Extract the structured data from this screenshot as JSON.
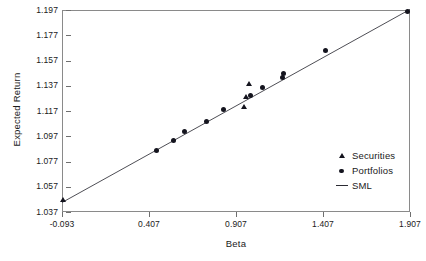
{
  "chart_data": {
    "type": "scatter",
    "title": "",
    "xlabel": "Beta",
    "ylabel": "Expected Return",
    "xlim": [
      -0.093,
      1.907
    ],
    "ylim": [
      1.037,
      1.197
    ],
    "grid": false,
    "legend_position": "bottom-right",
    "xticks": [
      "-0.093",
      "0.407",
      "0.907",
      "1.407",
      "1.907"
    ],
    "xtick_values": [
      -0.093,
      0.407,
      0.907,
      1.407,
      1.907
    ],
    "yticks": [
      "1.197",
      "1.177",
      "1.157",
      "1.137",
      "1.117",
      "1.097",
      "1.077",
      "1.057",
      "1.037"
    ],
    "ytick_values": [
      1.197,
      1.177,
      1.157,
      1.137,
      1.117,
      1.097,
      1.077,
      1.057,
      1.037
    ],
    "legend": [
      {
        "label": "Securities",
        "marker": "triangle-icon"
      },
      {
        "label": "Portfolios",
        "marker": "circle-icon"
      },
      {
        "label": "SML",
        "marker": "line-icon"
      }
    ],
    "series": [
      {
        "name": "Securities",
        "marker": "triangle",
        "points": [
          {
            "x": -0.085,
            "y": 1.0465
          },
          {
            "x": 0.955,
            "y": 1.1205
          },
          {
            "x": 0.963,
            "y": 1.1285
          },
          {
            "x": 0.985,
            "y": 1.1385
          }
        ]
      },
      {
        "name": "Portfolios",
        "marker": "circle",
        "points": [
          {
            "x": 0.452,
            "y": 1.0855
          },
          {
            "x": 0.545,
            "y": 1.0935
          },
          {
            "x": 0.612,
            "y": 1.1005
          },
          {
            "x": 0.74,
            "y": 1.109
          },
          {
            "x": 0.838,
            "y": 1.1185
          },
          {
            "x": 0.99,
            "y": 1.129
          },
          {
            "x": 1.062,
            "y": 1.1355
          },
          {
            "x": 1.172,
            "y": 1.1435
          },
          {
            "x": 1.178,
            "y": 1.1465
          },
          {
            "x": 1.42,
            "y": 1.165
          },
          {
            "x": 1.895,
            "y": 1.196
          }
        ]
      }
    ],
    "sml_line": {
      "name": "SML",
      "x0": -0.093,
      "y0": 1.0445,
      "x1": 1.907,
      "y1": 1.1975,
      "intercept": 1.0516,
      "slope": 0.0765
    }
  }
}
